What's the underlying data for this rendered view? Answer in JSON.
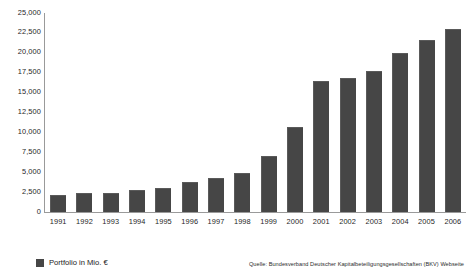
{
  "chart_data": {
    "type": "bar",
    "title": "",
    "xlabel": "",
    "ylabel": "",
    "categories": [
      "1991",
      "1992",
      "1993",
      "1994",
      "1995",
      "1996",
      "1997",
      "1998",
      "1999",
      "2000",
      "2001",
      "2002",
      "2003",
      "2004",
      "2005",
      "2006"
    ],
    "values": [
      2100,
      2400,
      2400,
      2750,
      3000,
      3750,
      4250,
      4900,
      7000,
      10700,
      16400,
      16800,
      17700,
      20000,
      21600,
      23000
    ],
    "series": [
      {
        "name": "Portfolio in Mio. €",
        "values": [
          2100,
          2400,
          2400,
          2750,
          3000,
          3750,
          4250,
          4900,
          7000,
          10700,
          16400,
          16800,
          17700,
          20000,
          21600,
          23000
        ]
      }
    ],
    "ylim": [
      0,
      25000
    ],
    "ytick_labels": [
      "25,000",
      "22,500",
      "20,000",
      "17,500",
      "15,000",
      "12,500",
      "10,000",
      "7,500",
      "5,000",
      "2,500",
      "0"
    ],
    "ytick_values": [
      25000,
      22500,
      20000,
      17500,
      15000,
      12500,
      10000,
      7500,
      5000,
      2500,
      0
    ],
    "grid": false,
    "legend_position": "bottom-left",
    "bar_color": "#464646",
    "axis_color": "#9a9a9a"
  },
  "legend": {
    "entries": [
      {
        "label": "Portfolio in Mio. €",
        "color": "#464646"
      }
    ]
  },
  "source": {
    "text": "Quelle: Bundesverband Deutscher Kapitalbeteiligungsgesellschaften (BKV) Webseite"
  }
}
